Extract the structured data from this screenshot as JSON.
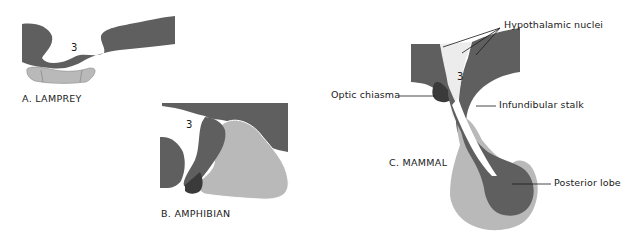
{
  "figure": {
    "colors": {
      "dark_tissue": "#5f5f5f",
      "light_lobe": "#b9b9b9",
      "darkest_tissue": "#3a3a3a",
      "ventricle_stipple": "#ececec",
      "background": "#ffffff",
      "label_text": "#1a1a1a"
    },
    "panels": [
      {
        "id": "A",
        "label": "A. LAMPREY",
        "ventricle_number": "3"
      },
      {
        "id": "B",
        "label": "B. AMPHIBIAN",
        "ventricle_number": "3"
      },
      {
        "id": "C",
        "label": "C. MAMMAL",
        "ventricle_number": "3",
        "annotations": [
          {
            "text": "Hypothalamic nuclei"
          },
          {
            "text": "Optic chiasma"
          },
          {
            "text": "Infundibular stalk"
          },
          {
            "text": "Posterior lobe"
          }
        ]
      }
    ]
  }
}
